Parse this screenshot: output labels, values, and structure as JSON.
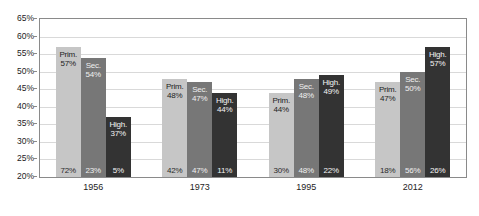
{
  "chart_data": {
    "type": "bar",
    "title": "",
    "subtitle": "",
    "xlabel": "",
    "ylabel": "",
    "ylim": [
      20,
      65
    ],
    "ytick_step": 5,
    "ytick_labels": [
      "65%",
      "60%",
      "55%",
      "50%",
      "45%",
      "40%",
      "35%",
      "30%",
      "25%",
      "20%"
    ],
    "ytick_values": [
      65,
      60,
      55,
      50,
      45,
      40,
      35,
      30,
      25,
      20
    ],
    "grid": true,
    "legend": "none (series labeled in-bar)",
    "categories": [
      "1956",
      "1973",
      "1995",
      "2012"
    ],
    "series": [
      {
        "name": "Prim.",
        "color": "#c6c6c6",
        "values": [
          57,
          48,
          44,
          47
        ],
        "value_labels": [
          "57%",
          "48%",
          "44%",
          "47%"
        ],
        "share_labels": [
          "72%",
          "42%",
          "30%",
          "18%"
        ]
      },
      {
        "name": "Sec.",
        "color": "#777777",
        "values": [
          54,
          47,
          48,
          50
        ],
        "value_labels": [
          "54%",
          "47%",
          "48%",
          "50%"
        ],
        "share_labels": [
          "23%",
          "47%",
          "48%",
          "56%"
        ]
      },
      {
        "name": "High.",
        "color": "#333333",
        "values": [
          37,
          44,
          49,
          57
        ],
        "value_labels": [
          "37%",
          "44%",
          "49%",
          "57%"
        ],
        "share_labels": [
          "5%",
          "11%",
          "22%",
          "26%"
        ]
      }
    ]
  },
  "axis": {
    "y_ticks": [
      {
        "label": "65%"
      },
      {
        "label": "60%"
      },
      {
        "label": "55%"
      },
      {
        "label": "50%"
      },
      {
        "label": "45%"
      },
      {
        "label": "40%"
      },
      {
        "label": "35%"
      },
      {
        "label": "30%"
      },
      {
        "label": "25%"
      },
      {
        "label": "20%"
      }
    ],
    "x_ticks": [
      {
        "label": "1956"
      },
      {
        "label": "1973"
      },
      {
        "label": "1995"
      },
      {
        "label": "2012"
      }
    ]
  },
  "bars": [
    {
      "group": "1956",
      "series": "Prim.",
      "value": 57,
      "value_label": "57%",
      "name_label": "Prim.",
      "share_label": "72%",
      "color": "#c6c6c6"
    },
    {
      "group": "1956",
      "series": "Sec.",
      "value": 54,
      "value_label": "54%",
      "name_label": "Sec.",
      "share_label": "23%",
      "color": "#777777"
    },
    {
      "group": "1956",
      "series": "High.",
      "value": 37,
      "value_label": "37%",
      "name_label": "High.",
      "share_label": "5%",
      "color": "#333333"
    },
    {
      "group": "1973",
      "series": "Prim.",
      "value": 48,
      "value_label": "48%",
      "name_label": "Prim.",
      "share_label": "42%",
      "color": "#c6c6c6"
    },
    {
      "group": "1973",
      "series": "Sec.",
      "value": 47,
      "value_label": "47%",
      "name_label": "Sec.",
      "share_label": "47%",
      "color": "#777777"
    },
    {
      "group": "1973",
      "series": "High.",
      "value": 44,
      "value_label": "44%",
      "name_label": "High.",
      "share_label": "11%",
      "color": "#333333"
    },
    {
      "group": "1995",
      "series": "Prim.",
      "value": 44,
      "value_label": "44%",
      "name_label": "Prim.",
      "share_label": "30%",
      "color": "#c6c6c6"
    },
    {
      "group": "1995",
      "series": "Sec.",
      "value": 48,
      "value_label": "48%",
      "name_label": "Sec.",
      "share_label": "48%",
      "color": "#777777"
    },
    {
      "group": "1995",
      "series": "High.",
      "value": 49,
      "value_label": "49%",
      "name_label": "High.",
      "share_label": "22%",
      "color": "#333333"
    },
    {
      "group": "2012",
      "series": "Prim.",
      "value": 47,
      "value_label": "47%",
      "name_label": "Prim.",
      "share_label": "18%",
      "color": "#c6c6c6"
    },
    {
      "group": "2012",
      "series": "Sec.",
      "value": 50,
      "value_label": "50%",
      "name_label": "Sec.",
      "share_label": "56%",
      "color": "#777777"
    },
    {
      "group": "2012",
      "series": "High.",
      "value": 57,
      "value_label": "57%",
      "name_label": "High.",
      "share_label": "26%",
      "color": "#333333"
    }
  ],
  "colors": {
    "primary_bar": "#c6c6c6",
    "secondary_bar": "#777777",
    "higher_bar": "#333333",
    "gridline": "#d9d9d9",
    "frame": "#8a8a8a",
    "text": "#1d1d1d"
  }
}
